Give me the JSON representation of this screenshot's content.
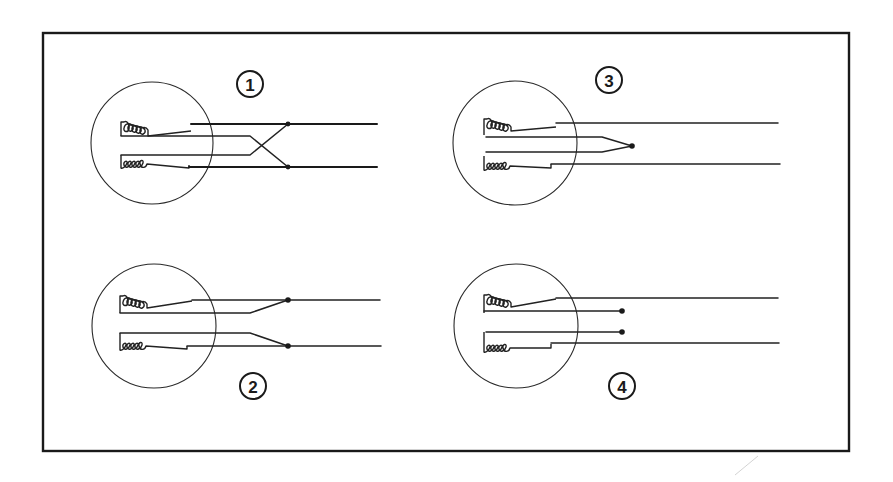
{
  "diagram": {
    "title": "",
    "panels": [
      {
        "id": "panel-1",
        "label": "1",
        "description": "Two coils, leads crossed over to opposite output lines"
      },
      {
        "id": "panel-2",
        "label": "2",
        "description": "Two coils, inner leads tied to outer leads at junction dots"
      },
      {
        "id": "panel-3",
        "label": "3",
        "description": "Two coils, inner leads joined together at a single junction"
      },
      {
        "id": "panel-4",
        "label": "4",
        "description": "Two coils, inner leads left open with terminal dots"
      }
    ],
    "colors": {
      "ink": "#1a1a1a",
      "background": "#ffffff"
    }
  }
}
